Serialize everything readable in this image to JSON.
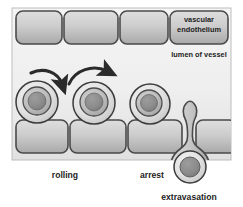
{
  "figure": {
    "frame": {
      "x": 12,
      "y": 8,
      "width": 219,
      "height": 152,
      "background_top": "#f2f2f2",
      "background_bottom": "#e3e3e3",
      "border_color": "#b4b4b4"
    }
  },
  "labels": {
    "vascular_endothelium_line1": "vascular",
    "vascular_endothelium_line2": "endothelium",
    "lumen_of_vessel": "lumen of vessel",
    "rolling": "rolling",
    "arrest": "arrest",
    "extravasation": "extravasation"
  },
  "colors": {
    "endothelium_fill_light": "#d3d3d3",
    "endothelium_fill_dark": "#b0b0b0",
    "endothelium_border": "#4a4a4a",
    "leukocyte_outer_fill": "#e6e6e6",
    "leukocyte_mid_fill": "#b9b9b9",
    "leukocyte_nucleus_fill": "#8a8a8a",
    "leukocyte_border": "#3c3c3c",
    "arrow_color": "#2b2b2b",
    "text_color": "#1d1d1d",
    "lumen_background": "#f4f4f4"
  },
  "endothelium": {
    "top_row": [
      {
        "id": "top-cell-1",
        "x": 16,
        "y": 12,
        "width": 46,
        "height": 32
      },
      {
        "id": "top-cell-2",
        "x": 64,
        "y": 12,
        "width": 54,
        "height": 32
      },
      {
        "id": "top-cell-3",
        "x": 120,
        "y": 12,
        "width": 48,
        "height": 32
      },
      {
        "id": "top-cell-4",
        "x": 170,
        "y": 12,
        "width": 58,
        "height": 32
      }
    ],
    "bottom_row": [
      {
        "id": "bottom-cell-1",
        "x": 16,
        "y": 120,
        "width": 52,
        "height": 32
      },
      {
        "id": "bottom-cell-2",
        "x": 70,
        "y": 120,
        "width": 56,
        "height": 32
      },
      {
        "id": "bottom-cell-3",
        "x": 128,
        "y": 120,
        "width": 54,
        "height": 32
      },
      {
        "id": "bottom-cell-4",
        "x": 196,
        "y": 120,
        "width": 36,
        "height": 32
      }
    ]
  },
  "leukocytes": [
    {
      "id": "leukocyte-rolling-1",
      "cx": 37,
      "cy": 102,
      "r_outer": 21,
      "r_mid": 14,
      "r_nucleus": 9,
      "stage": "rolling"
    },
    {
      "id": "leukocyte-rolling-2",
      "cx": 94,
      "cy": 103,
      "r_outer": 21,
      "r_mid": 14,
      "r_nucleus": 9,
      "stage": "rolling"
    },
    {
      "id": "leukocyte-arrest",
      "cx": 150,
      "cy": 104,
      "r_outer": 20,
      "r_mid": 13,
      "r_nucleus": 8.5,
      "stage": "arrest"
    },
    {
      "id": "leukocyte-extravasation",
      "cx": 190,
      "cy": 168,
      "r_outer": 16,
      "r_mid": 11,
      "r_nucleus": 8,
      "stage": "extravasation"
    }
  ],
  "arrows": [
    {
      "id": "rolling-arrow-left",
      "direction": "clockwise",
      "description": "curved arrow over first rolling leukocyte"
    },
    {
      "id": "rolling-arrow-right",
      "direction": "clockwise",
      "description": "curved arrow over second rolling leukocyte pointing right"
    }
  ],
  "label_positions": {
    "vascular_endothelium": {
      "x": 199,
      "y": 22,
      "anchor": "middle"
    },
    "lumen_of_vessel": {
      "x": 199,
      "y": 57,
      "anchor": "middle"
    },
    "rolling": {
      "x": 65,
      "y": 177,
      "anchor": "middle"
    },
    "arrest": {
      "x": 152,
      "y": 177,
      "anchor": "middle"
    },
    "extravasation": {
      "x": 190,
      "y": 199,
      "anchor": "middle"
    }
  }
}
